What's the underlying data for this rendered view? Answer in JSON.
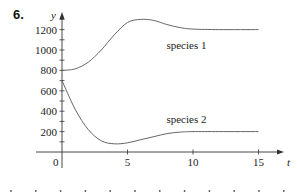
{
  "problem_number": "6.",
  "chart_data": {
    "type": "line",
    "title": "",
    "xlabel": "t",
    "ylabel": "y",
    "xlim": [
      -2,
      17
    ],
    "ylim": [
      -200,
      1350
    ],
    "x_ticks": [
      5,
      10,
      15
    ],
    "x_tick_labels": [
      "5",
      "10",
      "15"
    ],
    "y_ticks": [
      200,
      400,
      600,
      800,
      1000,
      1200
    ],
    "y_tick_labels": [
      "200",
      "400",
      "600",
      "800",
      "1000",
      "1200"
    ],
    "y_minor_tick_step": 100,
    "origin_label": "0",
    "grid": false,
    "legend": "inline labels",
    "series": [
      {
        "name": "species 1",
        "x": [
          0,
          1,
          2,
          3,
          4,
          5,
          6,
          7,
          8,
          9,
          10,
          12,
          15
        ],
        "values": [
          800,
          815,
          880,
          1000,
          1150,
          1270,
          1300,
          1290,
          1250,
          1220,
          1205,
          1200,
          1200
        ]
      },
      {
        "name": "species 2",
        "x": [
          0,
          1,
          2,
          3,
          4,
          5,
          6,
          7,
          8,
          9,
          10,
          12,
          15
        ],
        "values": [
          700,
          420,
          220,
          110,
          80,
          90,
          120,
          150,
          180,
          195,
          200,
          200,
          200
        ]
      }
    ],
    "annotations": [
      {
        "text": "species 1",
        "x": 9.5,
        "y": 1050
      },
      {
        "text": "species 2",
        "x": 9.5,
        "y": 320
      }
    ]
  },
  "footer_dots_count": 12
}
